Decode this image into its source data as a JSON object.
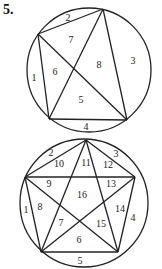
{
  "problem_number": "5.",
  "diagrams": [
    {
      "name": "circle-with-quadrilateral",
      "circle": {
        "cx": 89,
        "cy": 70,
        "r": 62
      },
      "vertices": {
        "A": [
          103,
          9
        ],
        "B": [
          38,
          34
        ],
        "C": [
          49,
          119
        ],
        "D": [
          127,
          120
        ]
      },
      "regions": [
        {
          "label": "1",
          "x": 34,
          "y": 79
        },
        {
          "label": "2",
          "x": 68,
          "y": 19
        },
        {
          "label": "3",
          "x": 133,
          "y": 62
        },
        {
          "label": "4",
          "x": 86,
          "y": 128
        },
        {
          "label": "5",
          "x": 81,
          "y": 101
        },
        {
          "label": "6",
          "x": 55,
          "y": 73
        },
        {
          "label": "7",
          "x": 71,
          "y": 41
        },
        {
          "label": "8",
          "x": 99,
          "y": 66
        }
      ]
    },
    {
      "name": "circle-with-pentagram",
      "circle": {
        "cx": 84,
        "cy": 203,
        "r": 64
      },
      "vertices": {
        "T": [
          86,
          140
        ],
        "L": [
          25,
          177
        ],
        "R": [
          135,
          177
        ],
        "BL": [
          41,
          252
        ],
        "BR": [
          118,
          252
        ]
      },
      "regions": [
        {
          "label": "1",
          "x": 26,
          "y": 211
        },
        {
          "label": "2",
          "x": 51,
          "y": 154
        },
        {
          "label": "3",
          "x": 116,
          "y": 155
        },
        {
          "label": "4",
          "x": 133,
          "y": 219
        },
        {
          "label": "5",
          "x": 80,
          "y": 262
        },
        {
          "label": "6",
          "x": 79,
          "y": 241
        },
        {
          "label": "7",
          "x": 61,
          "y": 224
        },
        {
          "label": "8",
          "x": 40,
          "y": 208
        },
        {
          "label": "9",
          "x": 49,
          "y": 185
        },
        {
          "label": "10",
          "x": 59,
          "y": 165
        },
        {
          "label": "11",
          "x": 86,
          "y": 164
        },
        {
          "label": "12",
          "x": 108,
          "y": 166
        },
        {
          "label": "13",
          "x": 111,
          "y": 185
        },
        {
          "label": "14",
          "x": 120,
          "y": 210
        },
        {
          "label": "15",
          "x": 101,
          "y": 225
        },
        {
          "label": "16",
          "x": 82,
          "y": 196
        }
      ]
    }
  ]
}
